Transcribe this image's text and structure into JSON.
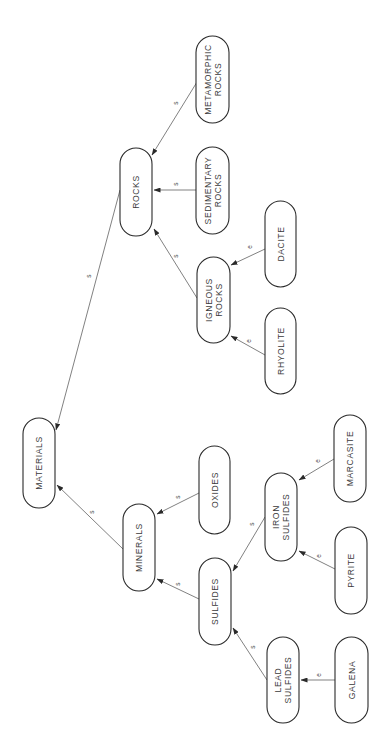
{
  "diagram": {
    "orientation": "rotated-90-ccw",
    "colors": {
      "background": "#ffffff",
      "stroke": "#2a2a2a",
      "text": "#3a3a3a"
    },
    "nodes": [
      {
        "id": "materials",
        "lines": [
          "MATERIALS"
        ],
        "x": 23,
        "y": 418,
        "w": 32,
        "h": 90
      },
      {
        "id": "rocks",
        "lines": [
          "ROCKS"
        ],
        "x": 120,
        "y": 148,
        "w": 32,
        "h": 88
      },
      {
        "id": "metamorphic-rocks",
        "lines": [
          "METAMORPHIC",
          "ROCKS"
        ],
        "x": 196,
        "y": 36,
        "w": 33,
        "h": 87
      },
      {
        "id": "sedimentary-rocks",
        "lines": [
          "SEDIMENTARY",
          "ROCKS"
        ],
        "x": 196,
        "y": 147,
        "w": 33,
        "h": 87
      },
      {
        "id": "igneous-rocks",
        "lines": [
          "IGNEOUS",
          "ROCKS"
        ],
        "x": 197,
        "y": 257,
        "w": 33,
        "h": 86
      },
      {
        "id": "dacite",
        "lines": [
          "DACITE"
        ],
        "x": 265,
        "y": 201,
        "w": 31,
        "h": 86
      },
      {
        "id": "rhyolite",
        "lines": [
          "RHYOLITE"
        ],
        "x": 265,
        "y": 308,
        "w": 31,
        "h": 86
      },
      {
        "id": "minerals",
        "lines": [
          "MINERALS"
        ],
        "x": 123,
        "y": 504,
        "w": 32,
        "h": 87
      },
      {
        "id": "oxides",
        "lines": [
          "OXIDES"
        ],
        "x": 199,
        "y": 446,
        "w": 31,
        "h": 88
      },
      {
        "id": "sulfides",
        "lines": [
          "SULFIDES"
        ],
        "x": 199,
        "y": 558,
        "w": 32,
        "h": 87
      },
      {
        "id": "iron-sulfides",
        "lines": [
          "IRON",
          "SULFIDES"
        ],
        "x": 265,
        "y": 473,
        "w": 32,
        "h": 88
      },
      {
        "id": "marcasite",
        "lines": [
          "MARCASITE"
        ],
        "x": 334,
        "y": 415,
        "w": 32,
        "h": 87
      },
      {
        "id": "pyrite",
        "lines": [
          "PYRITE"
        ],
        "x": 335,
        "y": 527,
        "w": 32,
        "h": 87
      },
      {
        "id": "lead-sulfides",
        "lines": [
          "LEAD",
          "SULFIDES"
        ],
        "x": 267,
        "y": 637,
        "w": 32,
        "h": 86
      },
      {
        "id": "galena",
        "lines": [
          "GALENA"
        ],
        "x": 335,
        "y": 637,
        "w": 33,
        "h": 86
      }
    ],
    "edges": [
      {
        "from": "rocks",
        "to": "materials",
        "label": "s",
        "x1": 120,
        "y1": 190,
        "x2": 56,
        "y2": 430,
        "lx": 91,
        "ly": 276
      },
      {
        "from": "metamorphic-rocks",
        "to": "rocks",
        "label": "s",
        "x1": 197,
        "y1": 82,
        "x2": 152,
        "y2": 155,
        "lx": 178,
        "ly": 103
      },
      {
        "from": "sedimentary-rocks",
        "to": "rocks",
        "label": "s",
        "x1": 196,
        "y1": 190,
        "x2": 154,
        "y2": 190,
        "lx": 178,
        "ly": 184
      },
      {
        "from": "igneous-rocks",
        "to": "rocks",
        "label": "s",
        "x1": 197,
        "y1": 298,
        "x2": 154,
        "y2": 229,
        "lx": 178,
        "ly": 256
      },
      {
        "from": "dacite",
        "to": "igneous-rocks",
        "label": "e",
        "x1": 265,
        "y1": 249,
        "x2": 231,
        "y2": 265,
        "lx": 252,
        "ly": 247
      },
      {
        "from": "rhyolite",
        "to": "igneous-rocks",
        "label": "e",
        "x1": 265,
        "y1": 355,
        "x2": 231,
        "y2": 336,
        "lx": 251,
        "ly": 341
      },
      {
        "from": "minerals",
        "to": "materials",
        "label": "s",
        "x1": 123,
        "y1": 549,
        "x2": 57,
        "y2": 485,
        "lx": 94,
        "ly": 512
      },
      {
        "from": "oxides",
        "to": "minerals",
        "label": "s",
        "x1": 199,
        "y1": 493,
        "x2": 157,
        "y2": 514,
        "lx": 180,
        "ly": 497
      },
      {
        "from": "sulfides",
        "to": "minerals",
        "label": "s",
        "x1": 199,
        "y1": 599,
        "x2": 157,
        "y2": 579,
        "lx": 180,
        "ly": 584
      },
      {
        "from": "iron-sulfides",
        "to": "sulfides",
        "label": "s",
        "x1": 265,
        "y1": 517,
        "x2": 233,
        "y2": 571,
        "lx": 254,
        "ly": 524
      },
      {
        "from": "marcasite",
        "to": "iron-sulfides",
        "label": "e",
        "x1": 334,
        "y1": 459,
        "x2": 299,
        "y2": 480,
        "lx": 320,
        "ly": 461
      },
      {
        "from": "pyrite",
        "to": "iron-sulfides",
        "label": "e",
        "x1": 335,
        "y1": 569,
        "x2": 299,
        "y2": 551,
        "lx": 321,
        "ly": 556
      },
      {
        "from": "lead-sulfides",
        "to": "sulfides",
        "label": "s",
        "x1": 267,
        "y1": 680,
        "x2": 233,
        "y2": 628,
        "lx": 255,
        "ly": 647
      },
      {
        "from": "galena",
        "to": "lead-sulfides",
        "label": "e",
        "x1": 335,
        "y1": 680,
        "x2": 301,
        "y2": 680,
        "lx": 321,
        "ly": 675
      }
    ]
  }
}
